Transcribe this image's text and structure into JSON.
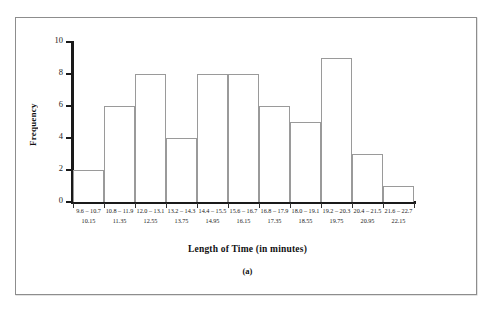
{
  "chart_data": {
    "type": "bar",
    "title": "",
    "xlabel": "Length of Time (in minutes)",
    "ylabel": "Frequency",
    "caption": "(a)",
    "ylim": [
      0,
      10
    ],
    "ytick_values": [
      0,
      2,
      4,
      6,
      8,
      10
    ],
    "grid": false,
    "legend": null,
    "bin_ranges": [
      "9.6 – 10.7",
      "10.8 – 11.9",
      "12.0 – 13.1",
      "13.2 – 14.3",
      "14.4 – 15.5",
      "15.6 – 16.7",
      "16.8 – 17.9",
      "18.0 – 19.1",
      "19.2 – 20.3",
      "20.4 – 21.5",
      "21.6 – 22.7"
    ],
    "bin_midpoints": [
      "10.15",
      "11.35",
      "12.55",
      "13.75",
      "14.95",
      "16.15",
      "17.35",
      "18.55",
      "19.75",
      "20.95",
      "22.15"
    ],
    "categories": [
      "9.6 – 10.7",
      "10.8 – 11.9",
      "12.0 – 13.1",
      "13.2 – 14.3",
      "14.4 – 15.5",
      "15.6 – 16.7",
      "16.8 – 17.9",
      "18.0 – 19.1",
      "19.2 – 20.3",
      "20.4 – 21.5",
      "21.6 – 22.7"
    ],
    "values": [
      2,
      6,
      8,
      4,
      8,
      8,
      6,
      5,
      9,
      3,
      1
    ],
    "colors": {
      "bar_fill": "#ffffff",
      "bar_stroke": "#9a9a9a",
      "axis": "#1a1a1a",
      "text": "#111111",
      "frame": "#8d8d8d"
    }
  }
}
